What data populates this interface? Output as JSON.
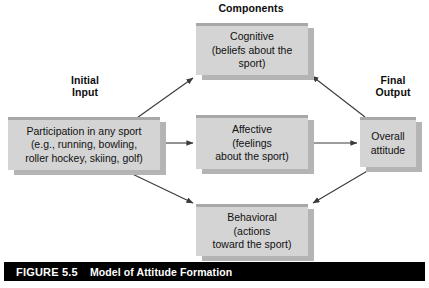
{
  "figure": {
    "number": "FIGURE 5.5",
    "title": "Model of Attitude Formation"
  },
  "labels": {
    "components": "Components",
    "initial_input": "Initial\nInput",
    "final_output": "Final\nOutput"
  },
  "nodes": {
    "participation": "Participation in any sport\n(e.g., running, bowling,\nroller hockey, skiing, golf)",
    "cognitive": "Cognitive\n(beliefs about the\nsport)",
    "affective": "Affective\n(feelings\nabout the sport)",
    "behavioral": "Behavioral\n(actions\ntoward the sport)",
    "overall": "Overall\nattitude"
  },
  "colors": {
    "box_face": "#d4d4d4",
    "box_shadow": "#b4b4b4",
    "box_top_edge": "#a8a8a8",
    "caption_bar": "#000000",
    "caption_text": "#ffffff",
    "connector": "#3a3a3a"
  },
  "connectors": [
    {
      "name": "participation-to-cognitive",
      "from": "participation",
      "to": "cognitive",
      "direction": "up-right"
    },
    {
      "name": "participation-to-affective",
      "from": "participation",
      "to": "affective",
      "direction": "right"
    },
    {
      "name": "participation-to-behavioral",
      "from": "participation",
      "to": "behavioral",
      "direction": "down-right"
    },
    {
      "name": "cognitive-to-overall",
      "from": "overall",
      "to": "cognitive",
      "direction": "up-left"
    },
    {
      "name": "affective-to-overall",
      "from": "affective",
      "to": "overall",
      "direction": "right"
    },
    {
      "name": "behavioral-to-overall",
      "from": "overall",
      "to": "behavioral",
      "direction": "down-left"
    }
  ]
}
